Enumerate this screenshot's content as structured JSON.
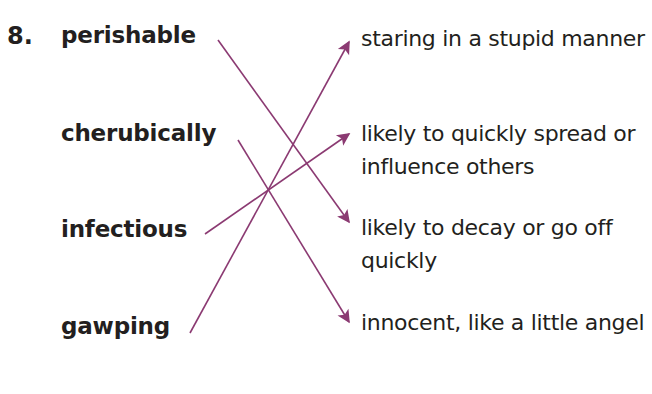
{
  "exercise": {
    "number": "8.",
    "accent_color": "#8b3a72",
    "text_color": "#231f20",
    "background_color": "#ffffff"
  },
  "terms": [
    {
      "label": "perishable"
    },
    {
      "label": "cherubically"
    },
    {
      "label": "infectious"
    },
    {
      "label": "gawping"
    }
  ],
  "definitions": [
    {
      "text": "staring in a stupid manner"
    },
    {
      "text": "likely to quickly spread or influence others"
    },
    {
      "text": "likely to decay or go off quickly"
    },
    {
      "text": "innocent, like a little angel"
    }
  ],
  "matches": [
    {
      "from": "perishable",
      "to": "likely to decay or go off quickly"
    },
    {
      "from": "cherubically",
      "to": "innocent, like a little angel"
    },
    {
      "from": "infectious",
      "to": "likely to quickly spread or influence others"
    },
    {
      "from": "gawping",
      "to": "staring in a stupid manner"
    }
  ]
}
